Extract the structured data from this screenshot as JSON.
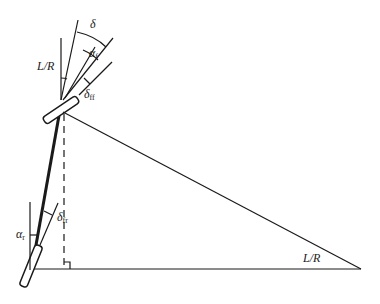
{
  "diagram": {
    "colors": {
      "stroke": "#1a1a1a",
      "background": "#ffffff"
    },
    "labels": {
      "front_L_over_R": "L/R",
      "steer_angle": "δ",
      "front_slip_symbol": "α",
      "front_slip_sub": "f",
      "front_delta_symbol": "δ",
      "front_delta_sub": "ff",
      "rear_slip_symbol": "α",
      "rear_slip_sub": "r",
      "rear_delta_symbol": "δ",
      "rear_delta_sub": "fr",
      "vertex_L_over_R": "L/R"
    }
  }
}
